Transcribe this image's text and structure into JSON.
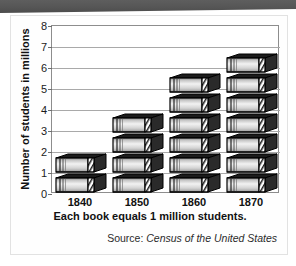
{
  "banner": {
    "name": "top-decoration-bar",
    "color": "#565656"
  },
  "card": {
    "background": "#fefefe",
    "border_color": "#e2e2e2"
  },
  "axis": {
    "y_title": "Number of students in millions",
    "y_ticks": [
      "0",
      "1",
      "2",
      "3",
      "4",
      "5",
      "6",
      "7",
      "8"
    ],
    "x_ticks": [
      "1840",
      "1850",
      "1860",
      "1870"
    ]
  },
  "caption": "Each book equals 1 million students.",
  "source": {
    "prefix": "Source: ",
    "title": "Census of the United States"
  },
  "chart_data": {
    "type": "bar",
    "title": "",
    "subtitle": "",
    "categories": [
      "1840",
      "1850",
      "1860",
      "1870"
    ],
    "values": [
      2,
      4,
      6,
      7
    ],
    "series": [
      {
        "name": "Number of students in millions",
        "values": [
          2,
          4,
          6,
          7
        ]
      }
    ],
    "xlabel": "Each book equals 1 million students.",
    "ylabel": "Number of students in millions",
    "ylim": [
      0,
      8
    ],
    "ytick_step": 1,
    "grid": true,
    "legend": false,
    "pictogram": {
      "symbol": "book",
      "unit_value": 1,
      "unit_label": "1 million students"
    },
    "annotations": [
      "Source: Census of the United States"
    ],
    "colors": {
      "book_body": "#d0d0d0",
      "book_outline": "#000000",
      "gridline": "#a9a9a9"
    }
  }
}
